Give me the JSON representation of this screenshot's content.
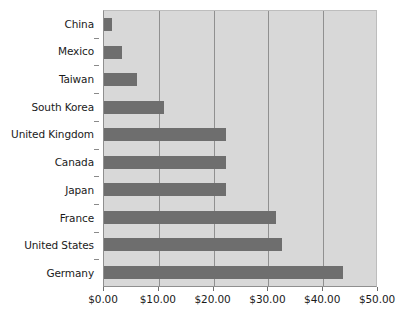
{
  "chart_data": {
    "type": "bar",
    "orientation": "horizontal",
    "title": "",
    "subtitle": "",
    "xlabel": "",
    "ylabel": "",
    "xlim": [
      0,
      50
    ],
    "ylim": null,
    "grid": true,
    "legend": false,
    "legend_position": "none",
    "categories": [
      "China",
      "Mexico",
      "Taiwan",
      "South Korea",
      "United Kingdom",
      "Canada",
      "Japan",
      "France",
      "United States",
      "Germany"
    ],
    "values": [
      1.4,
      3.2,
      6.1,
      10.9,
      22.3,
      22.3,
      22.3,
      31.4,
      32.4,
      43.7
    ],
    "x_tick_labels": [
      "$0.00",
      "$10.00",
      "$20.00",
      "$30.00",
      "$40.00",
      "$50.00"
    ],
    "x_tick_values": [
      0,
      10,
      20,
      30,
      40,
      50
    ],
    "y_tick_labels": [
      "China",
      "Mexico",
      "Taiwan",
      "South Korea",
      "United Kingdom",
      "Canada",
      "Japan",
      "France",
      "United States",
      "Germany"
    ],
    "colors": {
      "bar": "#6e6e6e",
      "plot_background": "#d8d8d8",
      "page_background": "#ffffff",
      "gridline": "#909090",
      "axis_line": "#8f8f8f",
      "text": "#1a1a1a"
    }
  }
}
